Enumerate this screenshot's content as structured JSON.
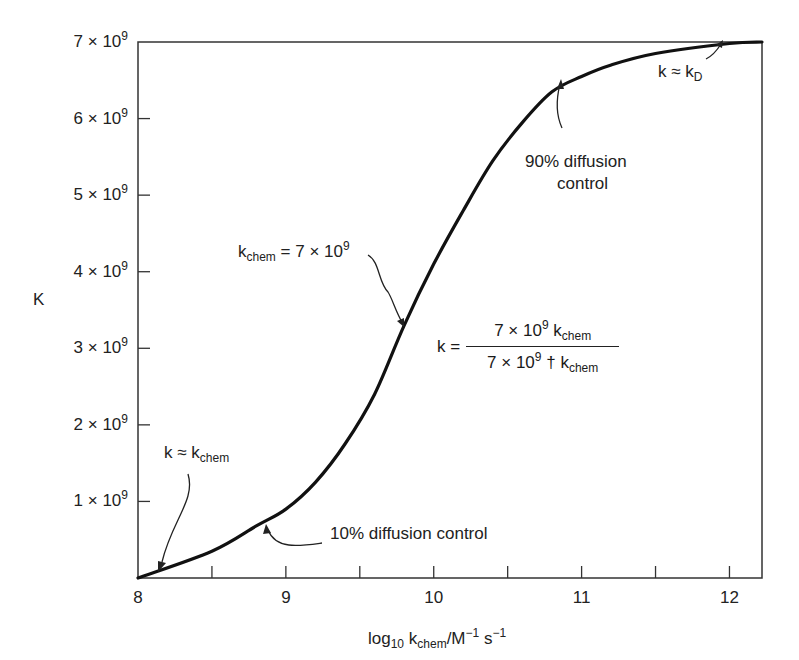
{
  "chart_data": {
    "type": "line",
    "title": "",
    "xlabel": "log10 kchem/M-1 s-1",
    "ylabel": "K",
    "xlim": [
      8,
      12.22
    ],
    "ylim": [
      0,
      7000000000.0
    ],
    "grid": false,
    "legend": null,
    "x_ticks": [
      "8",
      "9",
      "10",
      "11",
      "12"
    ],
    "x_minor_ticks": [
      8.5,
      9.5,
      10.5,
      11.5
    ],
    "y_ticks": [
      "1 × 10^9",
      "2 × 10^9",
      "3 × 10^9",
      "4 × 10^9",
      "5 × 10^9",
      "6 × 10^9",
      "7 × 10^9"
    ],
    "series": [
      {
        "name": "k",
        "x": [
          8.0,
          8.5,
          8.8,
          9.0,
          9.2,
          9.4,
          9.6,
          9.8,
          10.0,
          10.2,
          10.4,
          10.6,
          10.8,
          11.0,
          11.2,
          11.5,
          12.0,
          12.22
        ],
        "values": [
          0.0,
          350000000.0,
          680000000.0,
          900000000.0,
          1250000000.0,
          1750000000.0,
          2400000000.0,
          3300000000.0,
          4100000000.0,
          4800000000.0,
          5450000000.0,
          5950000000.0,
          6350000000.0,
          6550000000.0,
          6700000000.0,
          6850000000.0,
          6980000000.0,
          7000000000.0
        ]
      }
    ],
    "annotations": [
      {
        "text": "k ≈ kchem",
        "x": 8.15,
        "y": 150000000.0
      },
      {
        "text": "10% diffusion control",
        "x": 8.8,
        "y": 680000000.0
      },
      {
        "text": "kchem = 7 × 10^9",
        "x": 9.85,
        "y": 3400000000.0
      },
      {
        "text": "90% diffusion control",
        "x": 10.8,
        "y": 6400000000.0
      },
      {
        "text": "k ≈ kD",
        "x": 12.0,
        "y": 7000000000.0
      },
      {
        "text": "k = 7 × 10^9 kchem / (7 × 10^9 † kchem)",
        "x": 10.8,
        "y": 3100000000.0
      }
    ]
  },
  "axes": {
    "y_label": "K",
    "y_ticks": [
      {
        "coef": "7",
        "exp": "9"
      },
      {
        "coef": "6",
        "exp": "9"
      },
      {
        "coef": "5",
        "exp": "9"
      },
      {
        "coef": "4",
        "exp": "9"
      },
      {
        "coef": "3",
        "exp": "9"
      },
      {
        "coef": "2",
        "exp": "9"
      },
      {
        "coef": "1",
        "exp": "9"
      }
    ],
    "x_ticks": [
      "8",
      "9",
      "10",
      "11",
      "12"
    ],
    "x_label": {
      "log": "log",
      "log_sub": "10",
      "k": " k",
      "k_sub": "chem",
      "unit": "/M",
      "m_sup": "−1",
      "s": " s",
      "s_sup": "−1"
    }
  },
  "labels": {
    "k_approx_kchem": {
      "k": "k ≈ k",
      "sub": "chem"
    },
    "ten_percent": "10% diffusion control",
    "kchem_eq": {
      "k": "k",
      "sub": "chem",
      "rest": " = 7 × 10",
      "sup": "9"
    },
    "ninety_percent_line1": "90% diffusion",
    "ninety_percent_line2": "control",
    "k_approx_kd": {
      "k": "k ≈ k",
      "sub": "D"
    },
    "formula": {
      "lhs": "k =",
      "num_a": "7 × 10",
      "num_sup": "9",
      "num_b": " k",
      "num_sub": "chem",
      "den_a": "7 × 10",
      "den_sup": "9",
      "den_b": " † k",
      "den_sub": "chem"
    }
  },
  "colors": {
    "line": "#111111",
    "axis": "#333333",
    "text": "#222222"
  }
}
